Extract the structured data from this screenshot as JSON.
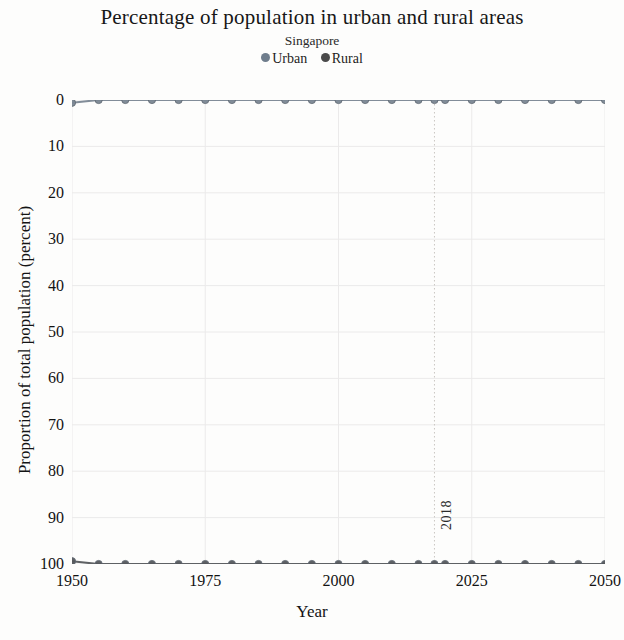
{
  "header": {
    "title": "Percentage of population in urban and rural areas",
    "subtitle": "Singapore"
  },
  "legend": {
    "position": "top",
    "items": [
      {
        "label": "Urban",
        "color": "#6f7d8c",
        "marker": "circle"
      },
      {
        "label": "Rural",
        "color": "#4a4a4a",
        "marker": "circle"
      }
    ]
  },
  "axes": {
    "x_title": "Year",
    "y_title": "Proportion of total population (percent)",
    "x_ticks": [
      "1950",
      "1975",
      "2000",
      "2025",
      "2050"
    ],
    "y_ticks": [
      "100",
      "90",
      "80",
      "70",
      "60",
      "50",
      "40",
      "30",
      "20",
      "10",
      "0"
    ]
  },
  "annotation": {
    "reference_year_label": "2018",
    "reference_year_value": 2018
  },
  "colors": {
    "urban_line": "#7b8793",
    "rural_line": "#55585c",
    "gridline": "#ebeaea",
    "reference_line": "#c9c6c2",
    "background": "#fdfdfc",
    "text": "#161616"
  },
  "chart_data": {
    "type": "line",
    "title": "Percentage of population in urban and rural areas",
    "subtitle": "Singapore",
    "xlabel": "Year",
    "ylabel": "Proportion of total population (percent)",
    "xlim": [
      1950,
      2050
    ],
    "ylim": [
      0,
      100
    ],
    "xticks": [
      1950,
      1975,
      2000,
      2025,
      2050
    ],
    "yticks": [
      0,
      10,
      20,
      30,
      40,
      50,
      60,
      70,
      80,
      90,
      100
    ],
    "grid": true,
    "legend_position": "top",
    "annotations": [
      {
        "type": "vline",
        "x": 2018,
        "label": "2018",
        "style": "dotted"
      }
    ],
    "x": [
      1950,
      1955,
      1960,
      1965,
      1970,
      1975,
      1980,
      1985,
      1990,
      1995,
      2000,
      2005,
      2010,
      2015,
      2018,
      2020,
      2025,
      2030,
      2035,
      2040,
      2045,
      2050
    ],
    "series": [
      {
        "name": "Urban",
        "color": "#7b8793",
        "marker": "circle",
        "values": [
          99.4,
          100.0,
          100.0,
          100.0,
          100.0,
          100.0,
          100.0,
          100.0,
          100.0,
          100.0,
          100.0,
          100.0,
          100.0,
          100.0,
          100.0,
          100.0,
          100.0,
          100.0,
          100.0,
          100.0,
          100.0,
          100.0
        ]
      },
      {
        "name": "Rural",
        "color": "#55585c",
        "marker": "circle",
        "values": [
          0.6,
          0.0,
          0.0,
          0.0,
          0.0,
          0.0,
          0.0,
          0.0,
          0.0,
          0.0,
          0.0,
          0.0,
          0.0,
          0.0,
          0.0,
          0.0,
          0.0,
          0.0,
          0.0,
          0.0,
          0.0,
          0.0
        ]
      }
    ]
  }
}
